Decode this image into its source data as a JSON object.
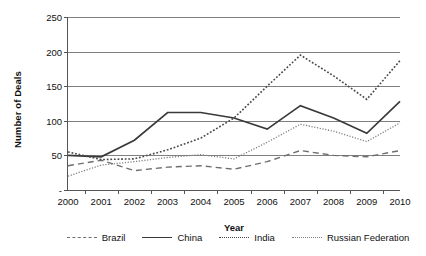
{
  "chart_data": {
    "type": "line",
    "title": "",
    "xlabel": "Year",
    "ylabel": "Number of Deals",
    "x": [
      2000,
      2001,
      2002,
      2003,
      2004,
      2005,
      2006,
      2007,
      2008,
      2009,
      2010
    ],
    "xtick_labels": [
      "2000",
      "2001",
      "2002",
      "2003",
      "2004",
      "2005",
      "2006",
      "2007",
      "2008",
      "2009",
      "2010"
    ],
    "ytick_labels": [
      "-",
      "50",
      "100",
      "150",
      "200",
      "250"
    ],
    "ytick_values": [
      0,
      50,
      100,
      150,
      200,
      250
    ],
    "ylim": [
      0,
      250
    ],
    "xlim": [
      2000,
      2010
    ],
    "grid": "horizontal",
    "legend_position": "bottom",
    "series": [
      {
        "name": "Brazil",
        "style": "dashed",
        "color": "#6e6e6e",
        "values": [
          35,
          43,
          28,
          33,
          35,
          30,
          41,
          57,
          50,
          48,
          57
        ]
      },
      {
        "name": "China",
        "style": "solid",
        "color": "#3a3a3a",
        "values": [
          50,
          48,
          72,
          112,
          112,
          104,
          88,
          122,
          104,
          82,
          128
        ]
      },
      {
        "name": "India",
        "style": "dotted",
        "color": "#4a4a4a",
        "values": [
          55,
          44,
          45,
          58,
          75,
          104,
          150,
          195,
          165,
          131,
          187
        ]
      },
      {
        "name": "Russian Federation",
        "style": "fine-dotted",
        "color": "#808080",
        "values": [
          20,
          36,
          41,
          47,
          51,
          45,
          69,
          95,
          85,
          70,
          97
        ]
      }
    ]
  },
  "legend": {
    "items": [
      {
        "label": "Brazil",
        "style": "dashed"
      },
      {
        "label": "China",
        "style": "solid"
      },
      {
        "label": "India",
        "style": "dotted"
      },
      {
        "label": "Russian Federation",
        "style": "fine-dotted"
      }
    ]
  }
}
